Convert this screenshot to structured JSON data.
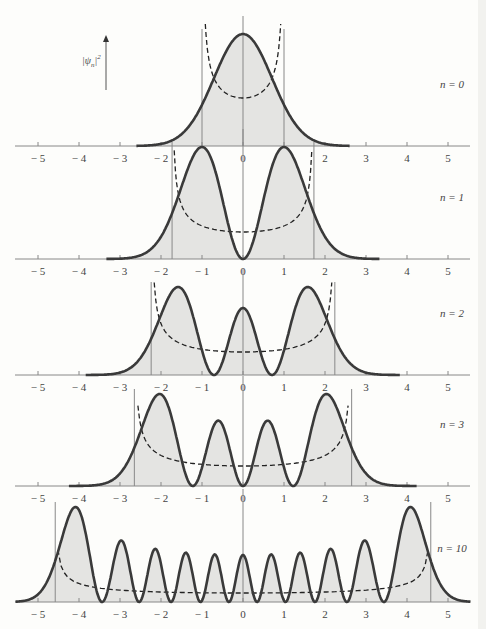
{
  "figure": {
    "ylabel": "|ψn|²",
    "ylabel_main": "|ψ",
    "ylabel_sub": "n",
    "ylabel_sup": "2",
    "x_ticks": [
      -5,
      -4,
      -3,
      -2,
      -1,
      0,
      1,
      2,
      3,
      4,
      5
    ],
    "x_tick_labels": [
      "− 5",
      "− 4",
      "− 3",
      "− 2",
      "− 1",
      "0",
      "1",
      "2",
      "3",
      "4",
      "5"
    ],
    "colors": {
      "curve": "#3a3a3a",
      "fill": "#e4e4e2",
      "axis": "#888888",
      "classical": "#222222"
    }
  },
  "chart_data": {
    "type": "line",
    "title": "",
    "xlabel": "",
    "ylabel": "|ψn|²",
    "xlim": [
      -5.5,
      5.5
    ],
    "grid": false,
    "panels": [
      {
        "n": 0,
        "label": "n = 0",
        "turning_points": [
          -1.0,
          1.0
        ],
        "peaks_x": [
          0
        ],
        "zeros_x": []
      },
      {
        "n": 1,
        "label": "n = 1",
        "turning_points": [
          -1.73,
          1.73
        ],
        "peaks_x": [
          -1,
          1
        ],
        "zeros_x": [
          0
        ]
      },
      {
        "n": 2,
        "label": "n = 2",
        "turning_points": [
          -2.24,
          2.24
        ],
        "peaks_x": [
          -1.7,
          0,
          1.7
        ],
        "zeros_x": [
          -0.71,
          0.71
        ]
      },
      {
        "n": 3,
        "label": "n = 3",
        "turning_points": [
          -2.65,
          2.65
        ],
        "peaks_x": [
          -2.0,
          -0.7,
          0.7,
          2.0
        ],
        "zeros_x": [
          -1.22,
          0,
          1.22
        ]
      },
      {
        "n": 10,
        "label": "n = 10",
        "turning_points": [
          -4.58,
          4.58
        ],
        "peaks_x": [
          -4.1,
          -3.0,
          -2.1,
          -1.3,
          -0.6,
          0,
          0.6,
          1.3,
          2.1,
          3.0,
          4.1
        ],
        "zeros_x": []
      }
    ]
  }
}
